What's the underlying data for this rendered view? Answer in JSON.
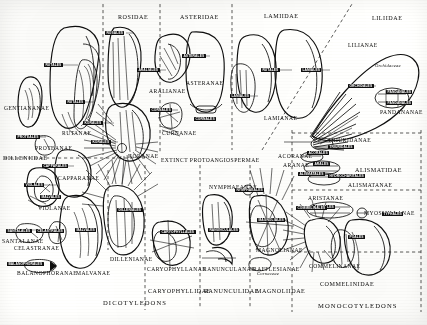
{
  "figure": {
    "type": "diagram",
    "division_labels": {
      "dicots": "DICOTYLEDONS",
      "monocots": "MONOCOTYLEDONS"
    }
  },
  "classes": [
    {
      "id": "rosidae",
      "label": "ROSIDAE",
      "x": 118,
      "y": 14
    },
    {
      "id": "asteridae",
      "label": "ASTERIDAE",
      "x": 185,
      "y": 14
    },
    {
      "id": "lamiidae",
      "label": "LAMIIDAE",
      "x": 268,
      "y": 13
    },
    {
      "id": "liliidae",
      "label": "LILIIDAE",
      "x": 375,
      "y": 15
    },
    {
      "id": "dilleniidae",
      "label": "DILLENIIDAE",
      "x": 3,
      "y": 155
    },
    {
      "id": "alismatidae",
      "label": "ALISMATIDAE",
      "x": 355,
      "y": 167
    },
    {
      "id": "caryophyllidae",
      "label": "CARYOPHYLLIDAE",
      "x": 152,
      "y": 288
    },
    {
      "id": "ranunculidae",
      "label": "RANUNCULIDAE",
      "x": 212,
      "y": 288
    },
    {
      "id": "magnoliidae",
      "label": "MAGNOLIIDAE",
      "x": 260,
      "y": 288
    },
    {
      "id": "commelinidae",
      "label": "COMMELINIDAE",
      "x": 325,
      "y": 281
    }
  ],
  "superorders": [
    {
      "id": "gentiananae",
      "label": "GENTIANANAE",
      "x": 5,
      "y": 107
    },
    {
      "id": "rutanae",
      "label": "RUTANAE",
      "x": 62,
      "y": 132
    },
    {
      "id": "proteanae",
      "label": "PROTEANAE",
      "x": 36,
      "y": 146
    },
    {
      "id": "capparanae",
      "label": "CAPPARANAE",
      "x": 58,
      "y": 176
    },
    {
      "id": "violanae",
      "label": "VIOLANAE",
      "x": 38,
      "y": 205
    },
    {
      "id": "santalanae",
      "label": "SANTALANAE",
      "x": 3,
      "y": 238
    },
    {
      "id": "celastranae",
      "label": "CELASTRANAE",
      "x": 14,
      "y": 245
    },
    {
      "id": "balanophoranae",
      "label": "BALANOPHORANAE",
      "x": 18,
      "y": 271
    },
    {
      "id": "malvanae",
      "label": "MALVANAE",
      "x": 77,
      "y": 271
    },
    {
      "id": "dillenianae",
      "label": "DILLENIANAE",
      "x": 113,
      "y": 257
    },
    {
      "id": "koranae",
      "label": "KORANAE",
      "x": 132,
      "y": 154
    },
    {
      "id": "aralianae",
      "label": "ARALIANAE",
      "x": 152,
      "y": 89
    },
    {
      "id": "asteranae",
      "label": "ASTERANAE",
      "x": 188,
      "y": 81
    },
    {
      "id": "curnanae",
      "label": "CURNANAE",
      "x": 165,
      "y": 131
    },
    {
      "id": "protoangio",
      "label": "EXTINCT PROTOANGIOSPERMAE",
      "x": 163,
      "y": 158
    },
    {
      "id": "caryophyllanae",
      "label": "CARYOPHYLLANAE",
      "x": 150,
      "y": 267
    },
    {
      "id": "nymphaeanae",
      "label": "NYMPHAEANAE",
      "x": 212,
      "y": 185
    },
    {
      "id": "ranunculanae",
      "label": "RANUNCULANAE",
      "x": 211,
      "y": 267
    },
    {
      "id": "rafflesianae",
      "label": "RAFFLESIANAE",
      "x": 255,
      "y": 267
    },
    {
      "id": "magnolianae",
      "label": "MAGNOLIANAE",
      "x": 258,
      "y": 248
    },
    {
      "id": "lamianae",
      "label": "LAMIANAE",
      "x": 268,
      "y": 116
    },
    {
      "id": "lilianae",
      "label": "LILIANAE",
      "x": 350,
      "y": 43
    },
    {
      "id": "pandananae",
      "label": "PANDANANAE",
      "x": 385,
      "y": 110
    },
    {
      "id": "triuridanae",
      "label": "TRIURIDANAE",
      "x": 330,
      "y": 139
    },
    {
      "id": "acoranae",
      "label": "ACORANAE",
      "x": 280,
      "y": 155
    },
    {
      "id": "aranae",
      "label": "ARANAE",
      "x": 285,
      "y": 163
    },
    {
      "id": "alismatanae",
      "label": "ALISMATANAE",
      "x": 352,
      "y": 182
    },
    {
      "id": "aristanae",
      "label": "ARISTANAE",
      "x": 310,
      "y": 197
    },
    {
      "id": "myosurananae",
      "label": "MYOSMILLANAE",
      "x": 368,
      "y": 212
    },
    {
      "id": "commelinanae",
      "label": "COMMELINANAE",
      "x": 313,
      "y": 264
    }
  ],
  "family_labels": [
    {
      "id": "orchidaceae",
      "label": "Orchidaceae",
      "x": 379,
      "y": 65
    },
    {
      "id": "curnaceae",
      "label": "Cornaceae",
      "x": 259,
      "y": 272
    }
  ],
  "floral_part_chips": [
    {
      "id": "c1",
      "label": "RUTALES",
      "x": 44,
      "y": 65
    },
    {
      "id": "c2",
      "label": "RUTALES",
      "x": 68,
      "y": 102
    },
    {
      "id": "c3",
      "label": "PROTEALES",
      "x": 18,
      "y": 137
    },
    {
      "id": "c4",
      "label": "CAPPARALES",
      "x": 44,
      "y": 166
    },
    {
      "id": "c5",
      "label": "VIOLALES",
      "x": 26,
      "y": 185
    },
    {
      "id": "c6",
      "label": "MALVALES",
      "x": 42,
      "y": 196
    },
    {
      "id": "c7",
      "label": "SANTALALES",
      "x": 8,
      "y": 230
    },
    {
      "id": "c8",
      "label": "CELASTRALES",
      "x": 38,
      "y": 230
    },
    {
      "id": "c9",
      "label": "BALANOPHORALES",
      "x": 9,
      "y": 263
    },
    {
      "id": "c10",
      "label": "ROSALES",
      "x": 107,
      "y": 33
    },
    {
      "id": "c11",
      "label": "KORALES",
      "x": 85,
      "y": 123
    },
    {
      "id": "c12",
      "label": "KORALES",
      "x": 93,
      "y": 142
    },
    {
      "id": "c13",
      "label": "ARALIALES",
      "x": 139,
      "y": 70
    },
    {
      "id": "c14",
      "label": "ASTERALES",
      "x": 184,
      "y": 56
    },
    {
      "id": "c15",
      "label": "CORNALES",
      "x": 152,
      "y": 110
    },
    {
      "id": "c16",
      "label": "CORNALES",
      "x": 196,
      "y": 119
    },
    {
      "id": "c17",
      "label": "LAMIALES",
      "x": 305,
      "y": 70
    },
    {
      "id": "c18",
      "label": "RUTALES",
      "x": 265,
      "y": 70
    },
    {
      "id": "c19",
      "label": "LAMIALES",
      "x": 233,
      "y": 96
    },
    {
      "id": "c20",
      "label": "ORCHIDALES",
      "x": 352,
      "y": 86
    },
    {
      "id": "c21",
      "label": "PANDANALES",
      "x": 391,
      "y": 92
    },
    {
      "id": "c22",
      "label": "PANDANALES",
      "x": 391,
      "y": 103
    },
    {
      "id": "c23",
      "label": "TRIURIDALES",
      "x": 331,
      "y": 147
    },
    {
      "id": "c24",
      "label": "ACORALES",
      "x": 310,
      "y": 153
    },
    {
      "id": "c25",
      "label": "ARALES",
      "x": 316,
      "y": 164
    },
    {
      "id": "c26",
      "label": "ALISMATALES",
      "x": 303,
      "y": 174
    },
    {
      "id": "c27",
      "label": "HYDROCHARITALES",
      "x": 332,
      "y": 176
    },
    {
      "id": "c28",
      "label": "ARISTALES",
      "x": 316,
      "y": 207
    },
    {
      "id": "c29",
      "label": "COMMELINALES",
      "x": 300,
      "y": 208
    },
    {
      "id": "c30",
      "label": "POALES",
      "x": 350,
      "y": 237
    },
    {
      "id": "c31",
      "label": "TYPHALES",
      "x": 386,
      "y": 214
    },
    {
      "id": "c32",
      "label": "CARYOPHYLLALES",
      "x": 164,
      "y": 232
    },
    {
      "id": "c33",
      "label": "RANUNCULALES",
      "x": 212,
      "y": 230
    },
    {
      "id": "c34",
      "label": "NYMPHAEALES",
      "x": 239,
      "y": 190
    },
    {
      "id": "c35",
      "label": "MAGNOLIALES",
      "x": 261,
      "y": 220
    },
    {
      "id": "c36",
      "label": "DILLENIALES",
      "x": 120,
      "y": 210
    },
    {
      "id": "c37",
      "label": "MALVALES",
      "x": 78,
      "y": 230
    }
  ]
}
